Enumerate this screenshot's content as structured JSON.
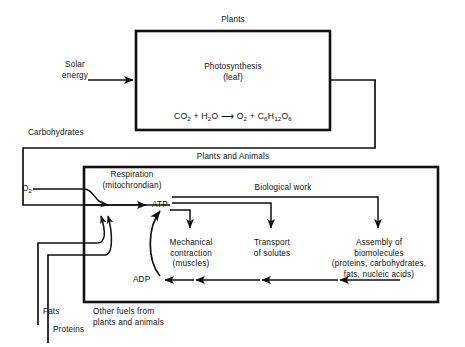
{
  "diagram": {
    "title_top_box": "Plants",
    "title_bottom_box": "Plants and Animals",
    "inputs": {
      "solar_energy": "Solar\nenergy",
      "oxygen": "O",
      "oxygen_sub": "2",
      "fats": "Fats",
      "proteins": "Proteins"
    },
    "photosynthesis": {
      "label": "Photosynthesis\n(leaf)",
      "equation_left": "CO",
      "equation": "CO2 + H2O ⟶ O2 + C6H12O6"
    },
    "flow_labels": {
      "carbohydrates": "Carbohydrates",
      "biological_work": "Biological work",
      "other_fuels": "Other fuels from\nplants and animals"
    },
    "respiration": {
      "label": "Respiration\n(mitochrondian)",
      "atp": "ATP",
      "adp": "ADP"
    },
    "work_outputs": [
      {
        "label": "Mechanical\ncontraction\n(muscles)"
      },
      {
        "label": "Transport\nof solutes"
      },
      {
        "label": "Assembly of\nbiomolecules\n(proteins, carbohydrates,\nfats, nucleic acids)"
      }
    ],
    "colors": {
      "ink": "#111111",
      "background": "#ffffff"
    }
  }
}
